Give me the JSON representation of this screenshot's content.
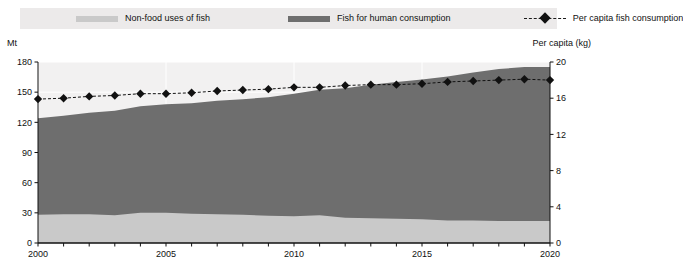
{
  "legend": {
    "items": [
      {
        "label": "Non-food uses of fish",
        "icon": "area-swatch-light",
        "color": "#c9c9c9"
      },
      {
        "label": "Fish for human consumption",
        "icon": "area-swatch-dark",
        "color": "#6e6e6e"
      },
      {
        "label": "Per capita fish consumption",
        "icon": "dashed-line-diamond-marker",
        "color": "#111111"
      }
    ]
  },
  "axis_captions": {
    "left": "Mt",
    "right": "Per capita (kg)"
  },
  "chart_data": {
    "type": "area",
    "title": "",
    "xlabel": "",
    "ylabel": "Mt",
    "y2label": "Per capita (kg)",
    "ylim": [
      0,
      180
    ],
    "y2lim": [
      0,
      20
    ],
    "xlim": [
      2000,
      2020
    ],
    "grid": true,
    "legend_position": "top",
    "stacked": true,
    "x": [
      2000,
      2001,
      2002,
      2003,
      2004,
      2005,
      2006,
      2007,
      2008,
      2009,
      2010,
      2011,
      2012,
      2013,
      2014,
      2015,
      2016,
      2017,
      2018,
      2019,
      2020
    ],
    "xticks": [
      2000,
      2005,
      2010,
      2015,
      2020
    ],
    "xtick_labels": [
      "2000",
      "2005",
      "2010",
      "2015",
      "2020"
    ],
    "yticks": [
      0,
      30,
      60,
      90,
      120,
      150,
      180
    ],
    "ytick_labels": [
      "0",
      "30",
      "60",
      "90",
      "120",
      "150",
      "180"
    ],
    "y2ticks": [
      0,
      4,
      8,
      12,
      16,
      20
    ],
    "y2tick_labels": [
      "0",
      "4",
      "8",
      "12",
      "16",
      "20"
    ],
    "series": [
      {
        "name": "Non-food uses of fish",
        "axis": "left",
        "kind": "area",
        "color": "#c9c9c9",
        "values": [
          28,
          28.5,
          28.5,
          27.5,
          30,
          30,
          29,
          28.5,
          28,
          27,
          26.5,
          27.5,
          25,
          24.5,
          24,
          23.5,
          22.5,
          22.5,
          22,
          22,
          22
        ]
      },
      {
        "name": "Fish for human consumption",
        "axis": "left",
        "kind": "area",
        "color": "#6e6e6e",
        "values": [
          96,
          98,
          101,
          104,
          106,
          108,
          110,
          113,
          115,
          118,
          122,
          125,
          129,
          133,
          136,
          139,
          143,
          147,
          151,
          153,
          153
        ]
      },
      {
        "name": "Per capita fish consumption",
        "axis": "right",
        "kind": "line",
        "color": "#111111",
        "marker": "diamond",
        "linestyle": "dashed",
        "values": [
          15.9,
          16.0,
          16.2,
          16.3,
          16.5,
          16.5,
          16.6,
          16.8,
          16.9,
          17.0,
          17.2,
          17.2,
          17.4,
          17.5,
          17.5,
          17.6,
          17.8,
          17.9,
          18.0,
          18.1,
          18.0
        ]
      }
    ],
    "totals": [
      124,
      126.5,
      129.5,
      131.5,
      136,
      138,
      139,
      141.5,
      143,
      145,
      148.5,
      152.5,
      154,
      157.5,
      160,
      162.5,
      165.5,
      169.5,
      173,
      175,
      175
    ]
  }
}
